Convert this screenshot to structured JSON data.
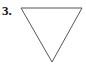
{
  "problem": {
    "number_label": "3."
  },
  "figure": {
    "shape": "inverted-triangle",
    "stroke_color": "#555555",
    "points": [
      [
        21,
        8
      ],
      [
        82,
        8
      ],
      [
        52,
        62
      ]
    ]
  }
}
